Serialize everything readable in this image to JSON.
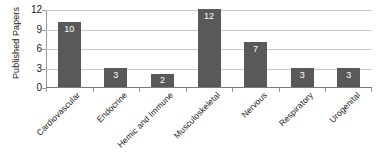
{
  "chart_data": {
    "type": "bar",
    "title": "",
    "xlabel": "",
    "ylabel": "Published Papers",
    "categories": [
      "Cardiovascular",
      "Endocrine",
      "Hemic and Immune",
      "Musculoskeletal",
      "Nervous",
      "Respiratory",
      "Urogenital"
    ],
    "values": [
      10,
      3,
      2,
      12,
      7,
      3,
      3
    ],
    "value_labels": [
      "10",
      "3",
      "2",
      "12",
      "7",
      "3",
      "3"
    ],
    "ylim": [
      0,
      12
    ],
    "yticks": [
      0,
      3,
      6,
      9,
      12
    ],
    "ytick_labels": [
      "0",
      "3",
      "6",
      "9",
      "12"
    ],
    "grid": "horizontal",
    "legend": "none",
    "bar_color": "#595959",
    "gridline_color": "#c9c9c9",
    "axis_color": "#7a7a7a",
    "label_color": "#1a1a1a",
    "value_label_color": "#ffffff",
    "background_color": "#ffffff"
  }
}
